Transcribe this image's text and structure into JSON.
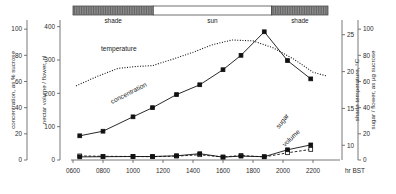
{
  "figure": {
    "xaxis_unit": "hr BST",
    "left_axis_1": {
      "label": "concentration, as % sucrose",
      "ticks": [
        "0",
        "20",
        "40",
        "60",
        "80",
        "100"
      ]
    },
    "left_axis_2": {
      "label": "nectar volume / flower, nl",
      "ticks": [
        "0",
        "100",
        "200",
        "300",
        "400"
      ]
    },
    "right_axis_1": {
      "label": "shade temperature, °C",
      "ticks": [
        "10",
        "15",
        "20",
        "25"
      ]
    },
    "right_axis_2": {
      "label": "sugar / flower, as µg sucrose",
      "ticks": [
        "0",
        "20",
        "40",
        "60",
        "80",
        "100"
      ]
    },
    "annotations": {
      "temperature": "temperature",
      "concentration": "concentration",
      "sugar": "sugar",
      "volume": "volume"
    },
    "shade_bar": {
      "segments": [
        {
          "label": "shade",
          "fill": "#8a8a8a",
          "start_hr": 600,
          "end_hr": 1135
        },
        {
          "label": "sun",
          "fill": "#ffffff",
          "start_hr": 1135,
          "end_hr": 1925
        },
        {
          "label": "shade",
          "fill": "#8a8a8a",
          "start_hr": 1925,
          "end_hr": 2300
        }
      ]
    }
  },
  "chart_data": {
    "type": "line",
    "title": "",
    "xlabel": "hr BST",
    "xlim": [
      600,
      2300
    ],
    "x_ticks": [
      600,
      800,
      1000,
      1200,
      1400,
      1600,
      1800,
      2000,
      2200
    ],
    "x_tick_labels": [
      "0600",
      "0800",
      "1000",
      "1200",
      "1400",
      "1600",
      "1800",
      "2000",
      "2200"
    ],
    "grid": false,
    "legend": "inline-annotations",
    "series": [
      {
        "name": "temperature",
        "axis": "right_1",
        "ylabel": "shade temperature, °C",
        "ylim": [
          8,
          27
        ],
        "style": "dotted",
        "marker": "none",
        "x": [
          620,
          760,
          900,
          1020,
          1130,
          1270,
          1400,
          1530,
          1660,
          1800,
          1930,
          2070,
          2200,
          2290
        ],
        "y": [
          13.5,
          15.5,
          17.2,
          17.6,
          17.8,
          19.2,
          20.6,
          22.2,
          23.2,
          23.0,
          21.6,
          19.2,
          16.4,
          15.6
        ]
      },
      {
        "name": "concentration",
        "axis": "left_1",
        "ylabel": "concentration, as % sucrose",
        "ylim": [
          0,
          107
        ],
        "style": "solid",
        "marker": "filled-square",
        "x": [
          645,
          800,
          1000,
          1130,
          1290,
          1445,
          1600,
          1720,
          1875,
          2030,
          2185
        ],
        "y": [
          18.5,
          22.0,
          33.0,
          40.0,
          50.0,
          57.5,
          69.0,
          80.0,
          98.0,
          76.0,
          62.0
        ]
      },
      {
        "name": "sugar",
        "axis": "right_2",
        "ylabel": "sugar / flower, as µg sucrose",
        "ylim": [
          0,
          107
        ],
        "style": "solid",
        "marker": "filled-square",
        "x": [
          645,
          800,
          1000,
          1130,
          1290,
          1445,
          1600,
          1720,
          1875,
          2030,
          2185
        ],
        "y": [
          3.0,
          3.5,
          4.0,
          4.0,
          6.0,
          11.5,
          2.5,
          5.0,
          3.5,
          22.0,
          35.0
        ]
      },
      {
        "name": "volume",
        "axis": "left_2",
        "ylabel": "nectar volume / flower, nl",
        "ylim": [
          0,
          420
        ],
        "style": "dashed",
        "marker": "open-square",
        "x": [
          645,
          800,
          1000,
          1130,
          1290,
          1445,
          1600,
          1720,
          1875,
          2030,
          2185
        ],
        "y": [
          22,
          18,
          16,
          14,
          20,
          34,
          10,
          26,
          12,
          55,
          90
        ]
      }
    ],
    "sugar_peak": {
      "x": 2110,
      "y": 54
    },
    "volume_peak": {
      "x": 2110,
      "y": 140
    }
  }
}
